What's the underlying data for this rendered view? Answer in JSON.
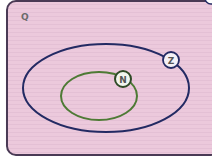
{
  "diagram": {
    "type": "venn-nested-sets",
    "universe": {
      "label": "Q",
      "fill": "#ecc9dc",
      "stroke": "#4a3a55"
    },
    "sets": [
      {
        "id": "Z",
        "label": "Z",
        "stroke": "#232a63",
        "contains": [
          "N"
        ]
      },
      {
        "id": "N",
        "label": "N",
        "stroke": "#4e7a35",
        "contains": []
      }
    ],
    "relationships": [
      "N ⊂ Z ⊂ Q"
    ]
  }
}
